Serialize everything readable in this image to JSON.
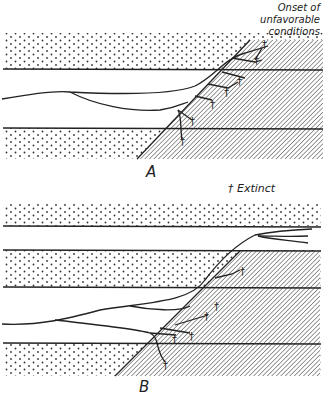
{
  "annotations": {
    "onset_line1": "Onset of",
    "onset_line2": "unfavorable",
    "onset_line3": "conditions",
    "legend_symbol": "†",
    "legend_text": "Extinct"
  },
  "panels": [
    {
      "label": "A"
    },
    {
      "label": "B"
    }
  ],
  "colors": {
    "ink": "#222222",
    "paper": "#ffffff"
  }
}
